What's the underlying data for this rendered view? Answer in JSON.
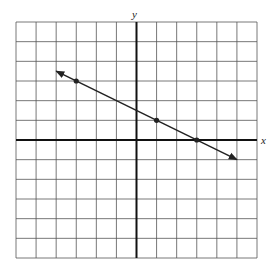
{
  "chart_data": {
    "type": "line",
    "title": "",
    "xlabel": "x",
    "ylabel": "y",
    "xlim": [
      -6,
      6
    ],
    "ylim": [
      -6,
      6
    ],
    "grid": true,
    "grid_step": 1,
    "tick_labels": false,
    "series": [
      {
        "name": "line",
        "equation": "y = -0.5x + 1.5",
        "points": [
          {
            "x": -3,
            "y": 3
          },
          {
            "x": 1,
            "y": 1
          },
          {
            "x": 3,
            "y": 0
          }
        ],
        "segment": {
          "start": {
            "x": -4,
            "y": 3.5
          },
          "end": {
            "x": 5,
            "y": -1
          }
        },
        "arrows_both_ends": true
      }
    ]
  },
  "labels": {
    "x_axis": "x",
    "y_axis": "y"
  },
  "colors": {
    "grid": "#555555",
    "axis": "#111111",
    "line": "#222222"
  }
}
